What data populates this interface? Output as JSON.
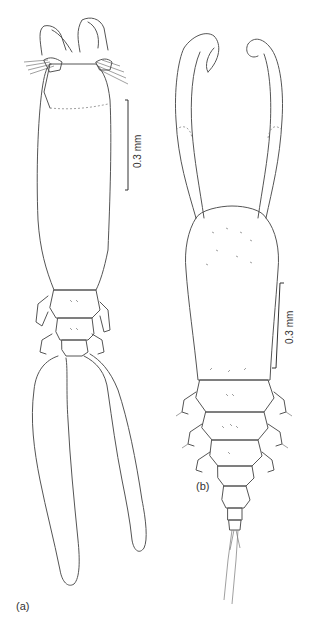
{
  "figure": {
    "panels": [
      {
        "id": "a",
        "label": "(a)",
        "scale_bar": {
          "label": "0.3 mm"
        }
      },
      {
        "id": "b",
        "label": "(b)",
        "scale_bar": {
          "label": "0.3 mm"
        }
      }
    ]
  }
}
